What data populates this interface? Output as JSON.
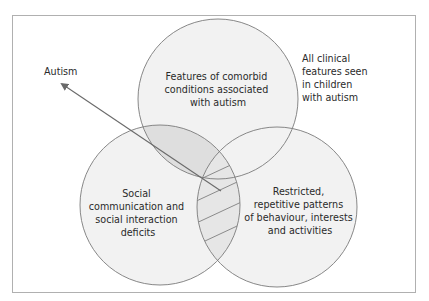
{
  "colors": {
    "frame": "#b0b0b0",
    "circle_fill": "#f2f2f2",
    "circle_stroke": "#7a7a7a",
    "overlap_top_left": "#dedede",
    "overlap_left_right": "#e6e6e6",
    "hatch": "#8a8a8a",
    "arrow": "#6a6a6a",
    "text": "#2a2a2a"
  },
  "outer_label": [
    "All clinical",
    "features seen",
    "in children",
    "with autism"
  ],
  "arrow_label": "Autism",
  "circles": [
    {
      "id": "comorbid",
      "lines": [
        "Features of comorbid",
        "conditions associated",
        "with autism"
      ]
    },
    {
      "id": "social",
      "lines": [
        "Social",
        "communication and",
        "social interaction",
        "deficits"
      ]
    },
    {
      "id": "restricted",
      "lines": [
        "Restricted,",
        "repetitive patterns",
        "of behaviour, interests",
        "and activities"
      ]
    }
  ],
  "overlaps": [
    {
      "between": [
        "comorbid",
        "social"
      ],
      "style": "shaded"
    },
    {
      "between": [
        "social",
        "restricted"
      ],
      "style": "hatched"
    }
  ]
}
